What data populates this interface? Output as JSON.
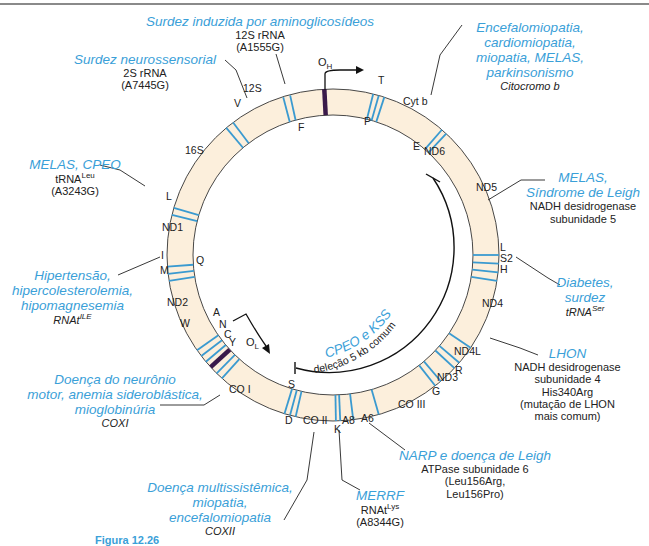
{
  "colors": {
    "disease_text": "#3aa0d8",
    "ring_fill": "#fcefdc",
    "trna_band": "#3a9ad0",
    "origin_band": "#3a1a4a",
    "text": "#222222"
  },
  "ring": {
    "segments": {
      "s12S": "12S",
      "s16S": "16S",
      "ND1": "ND1",
      "ND2": "ND2",
      "COI": "CO I",
      "COII": "CO II",
      "A8": "A8",
      "A6": "A6",
      "COIII": "CO III",
      "ND3": "ND3",
      "ND4L": "ND4L",
      "ND4": "ND4",
      "ND5": "ND5",
      "ND6": "ND6",
      "Cytb": "Cyt b"
    },
    "trna": {
      "F": "F",
      "V": "V",
      "L": "L",
      "I": "I",
      "Q": "Q",
      "M": "M",
      "W": "W",
      "A": "A",
      "N": "N",
      "C": "C",
      "Y": "Y",
      "S": "S",
      "D": "D",
      "K": "K",
      "G": "G",
      "R": "R",
      "H": "H",
      "S2": "S2",
      "L2": "L",
      "E": "E",
      "T": "T",
      "P": "P"
    },
    "origins": {
      "OH": "O",
      "OH_sub": "H",
      "OL": "O",
      "OL_sub": "L"
    }
  },
  "deletion": {
    "disease": "CPEO e KSS",
    "description": "deleção 5 kb comum"
  },
  "annotations": {
    "aminoglycoside": {
      "disease": "Surdez induzida por aminoglicosídeos",
      "gene": "12S rRNA",
      "mutation": "(A1555G)"
    },
    "sensorineural": {
      "disease": "Surdez neurossensorial",
      "gene": "2S rRNA",
      "mutation": "(A7445G)"
    },
    "cytb": {
      "disease_lines": [
        "Encefalomiopatia,",
        "cardiomiopatia,",
        "miopatia, MELAS,",
        "parkinsonismo"
      ],
      "gene": "Citocromo b"
    },
    "melas_cpeo": {
      "disease": "MELAS, CPEO",
      "gene": "tRNA",
      "gene_sup": "Leu",
      "mutation": "(A3243G)"
    },
    "nd5": {
      "disease_lines": [
        "MELAS,",
        "Síndrome de Leigh"
      ],
      "gene_lines": [
        "NADH desidrogenase",
        "subunidade 5"
      ]
    },
    "hypertension": {
      "disease_lines": [
        "Hipertensão,",
        "hipercolesterolemia,",
        "hipomagnesemia"
      ],
      "gene": "RNAt",
      "gene_sup": "ILE"
    },
    "diabetes": {
      "disease_lines": [
        "Diabetes,",
        "surdez"
      ],
      "gene": "tRNA",
      "gene_sup": "Ser"
    },
    "lhon": {
      "disease": "LHON",
      "gene_lines": [
        "NADH desidrogenase",
        "subunidade 4",
        "His340Arg",
        "(mutação de LHON",
        "mais comum)"
      ]
    },
    "coxi": {
      "disease_lines": [
        "Doença do neurônio",
        "motor, anemia sideroblástica,",
        "mioglobinúria"
      ],
      "gene": "COXI"
    },
    "narp": {
      "disease": "NARP e doença de Leigh",
      "gene_lines": [
        "ATPase subunidade 6",
        "(Leu156Arg,",
        "Leu156Pro)"
      ]
    },
    "coxii": {
      "disease_lines": [
        "Doença multissistêmica,",
        "miopatia,",
        "encefalomiopatia"
      ],
      "gene": "COXII"
    },
    "merrf": {
      "disease": "MERRF",
      "gene": "RNAt",
      "gene_sup": "Lys",
      "mutation": "(A8344G)"
    }
  },
  "caption": {
    "figure": "Figura 12.26"
  }
}
